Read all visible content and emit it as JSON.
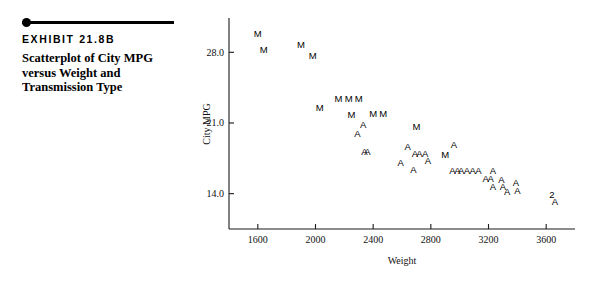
{
  "exhibit": {
    "number": "EXHIBIT 21.8B",
    "title": "Scatterplot of City MPG versus Weight and Transmission Type"
  },
  "chart_data": {
    "type": "scatter",
    "title": "",
    "xlabel": "Weight",
    "ylabel": "City MPG",
    "xticks": [
      1600,
      2000,
      2400,
      2800,
      3200,
      3600
    ],
    "yticks": [
      14.0,
      21.0,
      28.0
    ],
    "xtick_labels": [
      "1600",
      "2000",
      "2400",
      "2800",
      "3200",
      "3600"
    ],
    "ytick_labels": [
      "14.0",
      "21.0",
      "28.0"
    ],
    "xlim": [
      1400,
      3800
    ],
    "ylim": [
      10.5,
      31.0
    ],
    "grid": false,
    "legend": "none",
    "marker_note": "Marker glyph encodes Transmission Type: M = manual, A = automatic; a numeral marks that many coincident points.",
    "series": [
      {
        "name": "Manual",
        "glyph": "M",
        "points": [
          {
            "x": 1600,
            "y": 29.5,
            "label": "M"
          },
          {
            "x": 1640,
            "y": 27.9,
            "label": "M"
          },
          {
            "x": 1900,
            "y": 28.4,
            "label": "M"
          },
          {
            "x": 1980,
            "y": 27.3,
            "label": "M"
          },
          {
            "x": 2160,
            "y": 23.1,
            "label": "M"
          },
          {
            "x": 2230,
            "y": 23.1,
            "label": "M"
          },
          {
            "x": 2300,
            "y": 23.1,
            "label": "M"
          },
          {
            "x": 2030,
            "y": 22.2,
            "label": "M"
          },
          {
            "x": 2250,
            "y": 21.5,
            "label": "M"
          },
          {
            "x": 2400,
            "y": 21.6,
            "label": "M"
          },
          {
            "x": 2470,
            "y": 21.6,
            "label": "M"
          },
          {
            "x": 2700,
            "y": 20.3,
            "label": "M"
          },
          {
            "x": 2900,
            "y": 17.5,
            "label": "M"
          }
        ]
      },
      {
        "name": "Automatic",
        "glyph": "A",
        "points": [
          {
            "x": 2330,
            "y": 20.5,
            "label": "A"
          },
          {
            "x": 2290,
            "y": 19.6,
            "label": "A"
          },
          {
            "x": 2340,
            "y": 17.8,
            "label": "A"
          },
          {
            "x": 2360,
            "y": 17.8,
            "label": "A"
          },
          {
            "x": 2640,
            "y": 18.3,
            "label": "A"
          },
          {
            "x": 2690,
            "y": 17.6,
            "label": "A"
          },
          {
            "x": 2720,
            "y": 17.6,
            "label": "A"
          },
          {
            "x": 2760,
            "y": 17.6,
            "label": "A"
          },
          {
            "x": 2590,
            "y": 16.7,
            "label": "A"
          },
          {
            "x": 2780,
            "y": 16.9,
            "label": "A"
          },
          {
            "x": 2680,
            "y": 16.0,
            "label": "A"
          },
          {
            "x": 2960,
            "y": 18.5,
            "label": "A"
          },
          {
            "x": 2950,
            "y": 15.9,
            "label": "A"
          },
          {
            "x": 2985,
            "y": 15.9,
            "label": "A"
          },
          {
            "x": 3010,
            "y": 15.9,
            "label": "A"
          },
          {
            "x": 3050,
            "y": 15.9,
            "label": "A"
          },
          {
            "x": 3090,
            "y": 15.9,
            "label": "A"
          },
          {
            "x": 3130,
            "y": 15.9,
            "label": "A"
          },
          {
            "x": 3230,
            "y": 15.9,
            "label": "A"
          },
          {
            "x": 3180,
            "y": 15.2,
            "label": "A"
          },
          {
            "x": 3215,
            "y": 15.2,
            "label": "A"
          },
          {
            "x": 3290,
            "y": 15.1,
            "label": "A"
          },
          {
            "x": 3230,
            "y": 14.4,
            "label": "A"
          },
          {
            "x": 3300,
            "y": 14.4,
            "label": "A"
          },
          {
            "x": 3390,
            "y": 14.8,
            "label": "A"
          },
          {
            "x": 3330,
            "y": 13.9,
            "label": "A"
          },
          {
            "x": 3400,
            "y": 14.0,
            "label": "A"
          },
          {
            "x": 3660,
            "y": 12.9,
            "label": "A"
          }
        ]
      },
      {
        "name": "Coincident points",
        "glyph": "2",
        "points": [
          {
            "x": 3640,
            "y": 13.6,
            "label": "2"
          }
        ]
      }
    ]
  }
}
